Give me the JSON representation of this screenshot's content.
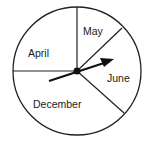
{
  "diagram": {
    "type": "spinner",
    "sections": [
      {
        "label": "May"
      },
      {
        "label": "April"
      },
      {
        "label": "June"
      },
      {
        "label": "December"
      }
    ],
    "arrow_points_to": "June",
    "colors": {
      "stroke": "#222222",
      "background": "#ffffff"
    }
  }
}
